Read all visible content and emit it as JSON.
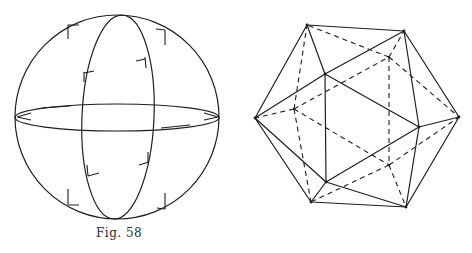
{
  "figures": [
    {
      "id": "fig58",
      "caption": "Fig. 58",
      "description": "Sphere with equator and meridian great circles, with direction-indicating tick marks",
      "sphere": {
        "cx": 117,
        "cy": 117,
        "r": 102
      },
      "meridian": {
        "cx": 118,
        "cy": 117,
        "rx": 36,
        "ry": 102,
        "rotate": 2.5
      },
      "equator": {
        "cx": 117,
        "cy": 117.5,
        "rx": 102,
        "ry": 13.5
      }
    },
    {
      "id": "fig59",
      "caption": "Fig. 59",
      "description": "Icosahedron with visible edges solid and hidden edges dashed",
      "vertices": {
        "A": [
          71,
          25
        ],
        "B": [
          168,
          31
        ],
        "C": [
          19,
          118
        ],
        "D": [
          223,
          117
        ],
        "E": [
          89,
          74
        ],
        "F": [
          183,
          127
        ],
        "G": [
          90,
          182
        ],
        "H": [
          75,
          202
        ],
        "I": [
          170,
          207
        ],
        "J": [
          58,
          109
        ],
        "K": [
          153,
          57
        ],
        "L": [
          153,
          165
        ]
      }
    }
  ],
  "colors": {
    "ink": "#1e1e1e",
    "paper": "#ffffff"
  }
}
